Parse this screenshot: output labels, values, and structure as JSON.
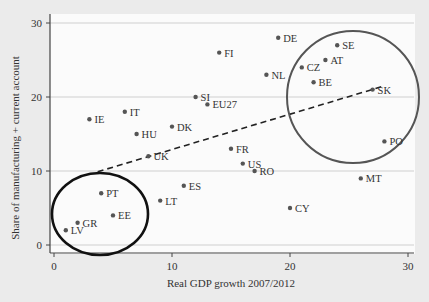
{
  "chart_data": {
    "type": "scatter",
    "title": "",
    "xlabel": "Real GDP growth 2007/2012",
    "ylabel": "Share of manufacturing + current account",
    "xlim": [
      0,
      30
    ],
    "ylim": [
      0,
      30
    ],
    "xticks": [
      0,
      10,
      20,
      30
    ],
    "yticks": [
      0,
      10,
      20,
      30
    ],
    "grid": "horizontal",
    "points": [
      {
        "label": "DE",
        "x": 19,
        "y": 28
      },
      {
        "label": "SE",
        "x": 24,
        "y": 27
      },
      {
        "label": "FI",
        "x": 14,
        "y": 26
      },
      {
        "label": "AT",
        "x": 23,
        "y": 25
      },
      {
        "label": "CZ",
        "x": 21,
        "y": 24
      },
      {
        "label": "NL",
        "x": 18,
        "y": 23
      },
      {
        "label": "BE",
        "x": 22,
        "y": 22
      },
      {
        "label": "SK",
        "x": 27,
        "y": 21
      },
      {
        "label": "SI",
        "x": 12,
        "y": 20
      },
      {
        "label": "EU27",
        "x": 13,
        "y": 19
      },
      {
        "label": "IT",
        "x": 6,
        "y": 18
      },
      {
        "label": "IE",
        "x": 3,
        "y": 17
      },
      {
        "label": "DK",
        "x": 10,
        "y": 16
      },
      {
        "label": "HU",
        "x": 7,
        "y": 15
      },
      {
        "label": "PO",
        "x": 28,
        "y": 14
      },
      {
        "label": "FR",
        "x": 15,
        "y": 13
      },
      {
        "label": "UK",
        "x": 8,
        "y": 12
      },
      {
        "label": "US",
        "x": 16,
        "y": 11
      },
      {
        "label": "RO",
        "x": 17,
        "y": 10
      },
      {
        "label": "MT",
        "x": 26,
        "y": 9
      },
      {
        "label": "ES",
        "x": 11,
        "y": 8
      },
      {
        "label": "PT",
        "x": 4,
        "y": 7
      },
      {
        "label": "LT",
        "x": 9,
        "y": 6
      },
      {
        "label": "CY",
        "x": 20,
        "y": 5
      },
      {
        "label": "EE",
        "x": 5,
        "y": 4
      },
      {
        "label": "GR",
        "x": 2,
        "y": 3
      },
      {
        "label": "LV",
        "x": 1,
        "y": 2
      }
    ],
    "trendline": {
      "style": "dashed",
      "from": {
        "x": 3.7,
        "y": 9.9
      },
      "to": {
        "x": 28,
        "y": 21.5
      }
    },
    "annotations": [
      {
        "type": "ellipse",
        "description": "black circle around low-growth cluster (LV, GR, EE, PT)",
        "cx": 3.9,
        "cy": 4.2,
        "color": "#111111"
      },
      {
        "type": "ellipse",
        "description": "gray circle around high-growth cluster (SE, AT, CZ, BE, SK, PO)",
        "cx": 25.3,
        "cy": 20,
        "color": "#555555"
      }
    ]
  }
}
